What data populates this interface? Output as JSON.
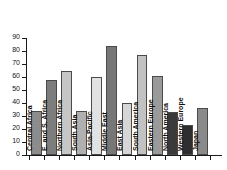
{
  "chart_data": {
    "type": "bar",
    "title": "",
    "subtitle": "",
    "xlabel": "",
    "ylabel": "",
    "ylim": [
      0,
      90
    ],
    "xlim": [
      0,
      12
    ],
    "grid": false,
    "legend": false,
    "legend_position": "none",
    "y_ticks": [
      90,
      80,
      70,
      60,
      50,
      40,
      30,
      20,
      10,
      0
    ],
    "y_tick_labels": [
      "90",
      "80",
      "70",
      "60",
      "50",
      "40",
      "30",
      "20",
      "10",
      "0"
    ],
    "x_tick_labels": [
      "",
      "",
      "",
      "",
      "",
      "",
      "",
      "",
      "",
      "",
      "",
      "",
      ""
    ],
    "categories": [
      "Central Africa",
      "E. and S. Africa",
      "Northern Africa",
      "South Asia",
      "Asia-Pacific",
      "Middle East",
      "East Asia",
      "South America",
      "Eastern Europe",
      "North America",
      "Western Europe",
      "Japan"
    ],
    "values": [
      34,
      58,
      65,
      34,
      60,
      84,
      40,
      77,
      61,
      33,
      23,
      36
    ],
    "bar_colors": [
      "#8c8c8c",
      "#7d7d7d",
      "#c6c6c6",
      "#b0b0b0",
      "#e2e2e2",
      "#777777",
      "#d6d6d6",
      "#c2c2c2",
      "#9a9a9a",
      "#3a3a3a",
      "#2e2e2e",
      "#8a8a8a"
    ],
    "bar_edge_color": "#4a4a4a",
    "axis_color": "#1a1a1a",
    "label_color": "#101010",
    "background_color": "#ffffff",
    "labels_inside_bars": true,
    "label_rotation": -90
  }
}
